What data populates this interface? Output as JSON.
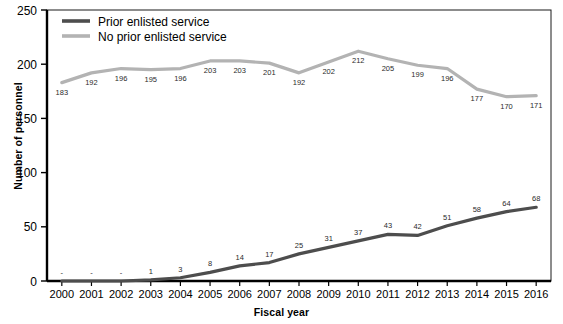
{
  "chart_data": {
    "type": "line",
    "title": "",
    "xlabel": "Fiscal year",
    "ylabel": "Number of personnel",
    "categories": [
      "2000",
      "2001",
      "2002",
      "2003",
      "2004",
      "2005",
      "2006",
      "2007",
      "2008",
      "2009",
      "2010",
      "2011",
      "2012",
      "2013",
      "2014",
      "2015",
      "2016"
    ],
    "x": [
      2000,
      2001,
      2002,
      2003,
      2004,
      2005,
      2006,
      2007,
      2008,
      2009,
      2010,
      2011,
      2012,
      2013,
      2014,
      2015,
      2016
    ],
    "ylim": [
      0,
      250
    ],
    "yticks": [
      0,
      50,
      100,
      150,
      200,
      250
    ],
    "ytick_labels": [
      "0",
      "50",
      "100",
      "150",
      "200",
      "250"
    ],
    "grid": false,
    "legend_position": "top-left",
    "series": [
      {
        "name": "Prior enlisted service",
        "color": "#4d4d4d",
        "values": [
          0,
          0,
          0,
          1,
          3,
          8,
          14,
          17,
          25,
          31,
          37,
          43,
          42,
          51,
          58,
          64,
          68
        ],
        "labels": [
          "-",
          "-",
          "-",
          "1",
          "3",
          "8",
          "14",
          "17",
          "25",
          "31",
          "37",
          "43",
          "42",
          "51",
          "58",
          "64",
          "68"
        ]
      },
      {
        "name": "No prior enlisted service",
        "color": "#b3b3b3",
        "values": [
          183,
          192,
          196,
          195,
          196,
          203,
          203,
          201,
          192,
          202,
          212,
          205,
          199,
          196,
          177,
          170,
          171
        ],
        "labels": [
          "183",
          "192",
          "196",
          "195",
          "196",
          "203",
          "203",
          "201",
          "192",
          "202",
          "212",
          "205",
          "199",
          "196",
          "177",
          "170",
          "171"
        ]
      }
    ]
  },
  "legend": {
    "entries": [
      {
        "label": "Prior enlisted service",
        "color": "#4d4d4d"
      },
      {
        "label": "No prior enlisted service",
        "color": "#b3b3b3"
      }
    ]
  },
  "colors": {
    "axis": "#000000",
    "frame": "#1a1a1a",
    "text": "#000000",
    "label_text": "#2b2b2b",
    "prior": "#4d4d4d",
    "no_prior": "#b3b3b3",
    "background": "#ffffff"
  }
}
